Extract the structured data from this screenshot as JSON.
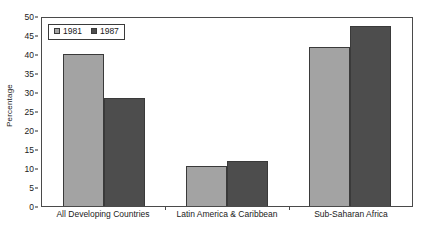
{
  "chart_data": {
    "type": "bar",
    "title": "",
    "xlabel": "",
    "ylabel": "Percentage",
    "ylim": [
      0,
      50
    ],
    "yticks": [
      0,
      5,
      10,
      15,
      20,
      25,
      30,
      35,
      40,
      45,
      50
    ],
    "ytick_labels": [
      "0",
      "5",
      "10",
      "15",
      "20",
      "25",
      "30",
      "35",
      "40",
      "45",
      "50"
    ],
    "grid": false,
    "legend_position": "top-left",
    "categories": [
      "All Developing Countries",
      "Latin America & Caribbean",
      "Sub-Saharan Africa"
    ],
    "series": [
      {
        "name": "1981",
        "color": "#a3a3a3",
        "values": [
          40.0,
          10.5,
          41.8
        ]
      },
      {
        "name": "1987",
        "color": "#4d4d4d",
        "values": [
          28.5,
          11.8,
          47.4
        ]
      }
    ]
  }
}
